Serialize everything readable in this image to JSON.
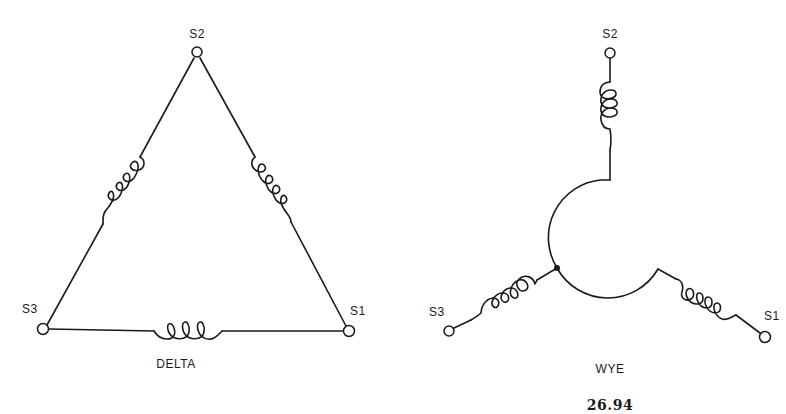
{
  "figure_number": "26.94",
  "delta": {
    "caption": "DELTA",
    "terminals": [
      {
        "id": "S1",
        "label": "S1"
      },
      {
        "id": "S2",
        "label": "S2"
      },
      {
        "id": "S3",
        "label": "S3"
      }
    ],
    "coils": 3
  },
  "wye": {
    "caption": "WYE",
    "terminals": [
      {
        "id": "S1",
        "label": "S1"
      },
      {
        "id": "S2",
        "label": "S2"
      },
      {
        "id": "S3",
        "label": "S3"
      }
    ],
    "coils": 3,
    "neutral_junction": true
  },
  "colors": {
    "line": "#1a1a1a",
    "background": "#ffffff"
  }
}
